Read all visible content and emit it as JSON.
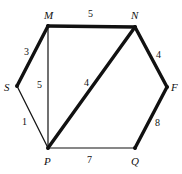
{
  "figure": {
    "type": "weighted-graph-diagram",
    "background_color": "#ffffff",
    "edge_color": "#111111",
    "label_color": "#111111"
  },
  "chart_data": {
    "type": "diagram",
    "title": "",
    "nodes": [
      {
        "id": "M",
        "label": "M",
        "x": 48,
        "y": 26,
        "label_x": 44,
        "label_y": 10,
        "label_anchor": "above-left"
      },
      {
        "id": "N",
        "label": "N",
        "x": 135,
        "y": 27,
        "label_x": 131,
        "label_y": 10,
        "label_anchor": "above-right"
      },
      {
        "id": "F",
        "label": "F",
        "x": 167,
        "y": 87,
        "label_x": 171,
        "label_y": 82,
        "label_anchor": "right"
      },
      {
        "id": "Q",
        "label": "Q",
        "x": 135,
        "y": 148,
        "label_x": 131,
        "label_y": 156,
        "label_anchor": "below"
      },
      {
        "id": "P",
        "label": "P",
        "x": 48,
        "y": 148,
        "label_x": 44,
        "label_y": 156,
        "label_anchor": "below"
      },
      {
        "id": "S",
        "label": "S",
        "x": 17,
        "y": 86,
        "label_x": 4,
        "label_y": 82,
        "label_anchor": "left"
      }
    ],
    "edges": [
      {
        "id": "MN",
        "from": "M",
        "to": "N",
        "weight": "5",
        "thick": true,
        "label_x": 88,
        "label_y": 9
      },
      {
        "id": "MS",
        "from": "M",
        "to": "S",
        "weight": "3",
        "thick": true,
        "label_x": 24,
        "label_y": 47
      },
      {
        "id": "SP",
        "from": "S",
        "to": "P",
        "weight": "1",
        "thick": false,
        "label_x": 22,
        "label_y": 117
      },
      {
        "id": "MP",
        "from": "M",
        "to": "P",
        "weight": "5",
        "thick": false,
        "label_x": 37,
        "label_y": 80
      },
      {
        "id": "PN",
        "from": "P",
        "to": "N",
        "weight": "4",
        "thick": true,
        "label_x": 84,
        "label_y": 78
      },
      {
        "id": "NF",
        "from": "N",
        "to": "F",
        "weight": "4",
        "thick": true,
        "label_x": 156,
        "label_y": 50
      },
      {
        "id": "FQ",
        "from": "F",
        "to": "Q",
        "weight": "8",
        "thick": true,
        "label_x": 155,
        "label_y": 118
      },
      {
        "id": "PQ",
        "from": "P",
        "to": "Q",
        "weight": "7",
        "thick": false,
        "label_x": 87,
        "label_y": 155
      }
    ],
    "xlim": [
      0,
      182
    ],
    "ylim": [
      0,
      174
    ],
    "grid": false,
    "legend": "none"
  }
}
